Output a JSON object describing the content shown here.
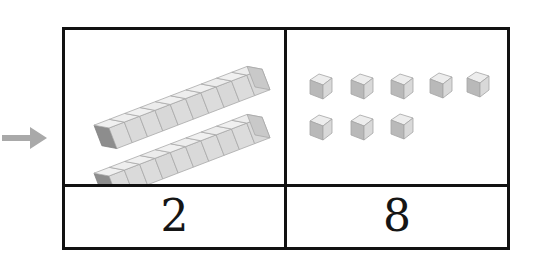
{
  "canvas": {
    "width": 538,
    "height": 268,
    "background": "#ffffff"
  },
  "arrow": {
    "icon": "arrow-right-icon",
    "color": "#a9a9a9",
    "direction": "right"
  },
  "place_value_table": {
    "border_color": "#111111",
    "background": "#ffffff",
    "columns": [
      {
        "name": "tens",
        "digit": "2",
        "manipulative": "ten-rod",
        "manipulative_count": 2,
        "cubes_per_manipulative": 10,
        "total_cubes": 20
      },
      {
        "name": "ones",
        "digit": "8",
        "manipulative": "unit-cube",
        "manipulative_count": 8,
        "rows": [
          5,
          3
        ],
        "total_cubes": 8
      }
    ]
  },
  "blocks": {
    "cube_colors": {
      "top_face": "#ededed",
      "right_face": "#d4d4d4",
      "left_face": "#bdbdbd",
      "edge": "#9a9a9a",
      "end_cap": "#8f8f8f"
    },
    "tens_rods": [
      {
        "id": "rod-1",
        "x": 42,
        "y": 78,
        "angle": -21,
        "segments": 10
      },
      {
        "id": "rod-2",
        "x": 42,
        "y": 126,
        "angle": -21,
        "segments": 10
      }
    ],
    "ones_cubes": [
      {
        "id": "cube-1",
        "x": 18,
        "y": 42
      },
      {
        "id": "cube-2",
        "x": 59,
        "y": 42
      },
      {
        "id": "cube-3",
        "x": 100,
        "y": 42
      },
      {
        "id": "cube-4",
        "x": 140,
        "y": 42
      },
      {
        "id": "cube-5",
        "x": 178,
        "y": 42
      },
      {
        "id": "cube-6",
        "x": 18,
        "y": 82
      },
      {
        "id": "cube-7",
        "x": 59,
        "y": 82
      },
      {
        "id": "cube-8",
        "x": 100,
        "y": 82
      }
    ]
  }
}
